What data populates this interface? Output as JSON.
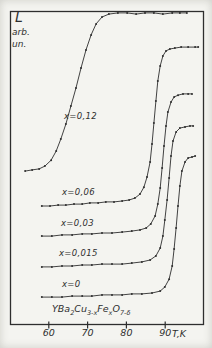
{
  "figure": {
    "kind": "scanned hand-drawn scientific plot",
    "ink_color": "#2e2e2e",
    "paper_color": "#f4f4f0"
  },
  "y_axis": {
    "label_main": "L",
    "label_sub1": "arb.",
    "label_sub2": "un.",
    "scale": "arbitrary units (no numeric ticks)"
  },
  "x_axis": {
    "unit_label": "T,K",
    "t_min": 50,
    "px_at_min": 10,
    "px_per_unit": 3.88,
    "ticks": [
      {
        "value": 60,
        "label": "60"
      },
      {
        "value": 70,
        "label": "70"
      },
      {
        "value": 80,
        "label": "80"
      },
      {
        "value": 90,
        "label": "90"
      }
    ]
  },
  "plot_box": {
    "x": 10,
    "y": 11,
    "w": 194,
    "h": 314
  },
  "compound": {
    "plain": "YBa2Cu3-xFexO7-δ",
    "segments": [
      {
        "t": "YBa"
      },
      {
        "t": "2",
        "sub": true
      },
      {
        "t": "Cu"
      },
      {
        "t": "3-x",
        "sub": true
      },
      {
        "t": "Fe"
      },
      {
        "t": "x",
        "sub": true
      },
      {
        "t": "O"
      },
      {
        "t": "7-δ",
        "sub": true
      }
    ]
  },
  "chart_data": {
    "type": "line",
    "title": "",
    "xlabel": "T,K",
    "ylabel": "L, arb. un.",
    "xlim": [
      50,
      100.5
    ],
    "ylim_note": "L is in arbitrary units; values below are percent of plot height as drawn (curves vertically offset in the original figure)",
    "grid": false,
    "marker": "dot markers along every curve",
    "series": [
      {
        "name": "x=0.12",
        "label": "x=0,12",
        "x_value": 0.12,
        "label_pos": [
          64,
          111
        ],
        "points": [
          [
            53.9,
            49.0
          ],
          [
            55.7,
            49.4
          ],
          [
            57.5,
            49.7
          ],
          [
            59.0,
            50.6
          ],
          [
            60.6,
            52.5
          ],
          [
            61.9,
            55.4
          ],
          [
            63.1,
            59.2
          ],
          [
            64.4,
            64.0
          ],
          [
            65.7,
            69.7
          ],
          [
            67.0,
            75.5
          ],
          [
            68.3,
            81.8
          ],
          [
            69.6,
            87.6
          ],
          [
            70.9,
            92.4
          ],
          [
            72.2,
            95.9
          ],
          [
            73.7,
            98.1
          ],
          [
            75.5,
            99.0
          ],
          [
            77.8,
            99.4
          ],
          [
            80.2,
            99.4
          ],
          [
            82.5,
            99.0
          ],
          [
            84.8,
            99.4
          ],
          [
            87.1,
            99.4
          ],
          [
            89.4,
            99.0
          ],
          [
            91.8,
            99.4
          ],
          [
            93.8,
            99.4
          ],
          [
            95.6,
            99.4
          ]
        ]
      },
      {
        "name": "x=0.06",
        "label": "x=0,06",
        "x_value": 0.06,
        "label_pos": [
          62,
          187
        ],
        "points": [
          [
            58.2,
            37.9
          ],
          [
            60.3,
            37.9
          ],
          [
            62.4,
            38.2
          ],
          [
            64.4,
            38.2
          ],
          [
            66.5,
            38.5
          ],
          [
            68.6,
            38.5
          ],
          [
            70.6,
            38.9
          ],
          [
            72.7,
            38.9
          ],
          [
            74.7,
            39.2
          ],
          [
            76.8,
            39.2
          ],
          [
            78.9,
            39.5
          ],
          [
            80.7,
            39.8
          ],
          [
            82.2,
            40.4
          ],
          [
            83.5,
            41.7
          ],
          [
            84.5,
            43.9
          ],
          [
            85.3,
            47.1
          ],
          [
            86.1,
            51.9
          ],
          [
            86.6,
            57.6
          ],
          [
            87.1,
            64.3
          ],
          [
            87.6,
            71.3
          ],
          [
            88.1,
            77.7
          ],
          [
            88.7,
            82.5
          ],
          [
            89.4,
            85.7
          ],
          [
            90.2,
            87.3
          ],
          [
            91.2,
            87.9
          ],
          [
            92.5,
            88.2
          ],
          [
            94.1,
            88.5
          ],
          [
            95.9,
            88.5
          ],
          [
            97.7,
            88.5
          ],
          [
            98.5,
            88.5
          ]
        ]
      },
      {
        "name": "x=0.03",
        "label": "x=0,03",
        "x_value": 0.03,
        "label_pos": [
          61,
          218
        ],
        "points": [
          [
            58.2,
            28.3
          ],
          [
            60.8,
            28.3
          ],
          [
            63.4,
            28.7
          ],
          [
            66.0,
            28.7
          ],
          [
            68.6,
            29.0
          ],
          [
            71.1,
            29.0
          ],
          [
            73.7,
            29.3
          ],
          [
            76.3,
            29.3
          ],
          [
            78.9,
            29.6
          ],
          [
            81.4,
            29.9
          ],
          [
            83.5,
            30.3
          ],
          [
            85.1,
            30.9
          ],
          [
            86.3,
            32.2
          ],
          [
            87.4,
            34.7
          ],
          [
            88.1,
            38.5
          ],
          [
            88.7,
            43.6
          ],
          [
            89.2,
            50.0
          ],
          [
            89.7,
            57.0
          ],
          [
            90.2,
            63.4
          ],
          [
            90.7,
            67.8
          ],
          [
            91.5,
            71.0
          ],
          [
            92.3,
            72.6
          ],
          [
            93.3,
            73.2
          ],
          [
            94.6,
            73.6
          ],
          [
            95.9,
            73.6
          ],
          [
            96.9,
            73.6
          ]
        ]
      },
      {
        "name": "x=0.015",
        "label": "x=0,015",
        "x_value": 0.015,
        "label_pos": [
          59,
          248
        ],
        "points": [
          [
            58.2,
            18.5
          ],
          [
            60.8,
            18.5
          ],
          [
            63.4,
            18.8
          ],
          [
            66.0,
            18.8
          ],
          [
            68.6,
            19.1
          ],
          [
            71.1,
            19.1
          ],
          [
            73.7,
            19.4
          ],
          [
            76.3,
            19.4
          ],
          [
            78.9,
            19.4
          ],
          [
            81.4,
            19.7
          ],
          [
            84.0,
            20.1
          ],
          [
            86.1,
            20.7
          ],
          [
            87.6,
            22.0
          ],
          [
            88.7,
            24.5
          ],
          [
            89.4,
            28.3
          ],
          [
            89.9,
            33.4
          ],
          [
            90.5,
            39.8
          ],
          [
            91.0,
            46.8
          ],
          [
            91.5,
            53.8
          ],
          [
            92.0,
            58.6
          ],
          [
            92.8,
            61.5
          ],
          [
            93.8,
            62.7
          ],
          [
            95.1,
            63.1
          ],
          [
            96.4,
            63.4
          ],
          [
            97.2,
            63.4
          ]
        ]
      },
      {
        "name": "x=0",
        "label": "x=0",
        "x_value": 0,
        "label_pos": [
          62,
          279
        ],
        "points": [
          [
            58.2,
            8.9
          ],
          [
            60.8,
            8.9
          ],
          [
            63.4,
            8.9
          ],
          [
            66.0,
            9.2
          ],
          [
            68.6,
            9.2
          ],
          [
            71.1,
            9.2
          ],
          [
            73.7,
            9.6
          ],
          [
            76.3,
            9.6
          ],
          [
            78.9,
            9.6
          ],
          [
            81.4,
            9.9
          ],
          [
            84.0,
            9.9
          ],
          [
            86.6,
            10.2
          ],
          [
            88.7,
            10.8
          ],
          [
            89.9,
            12.1
          ],
          [
            91.0,
            14.6
          ],
          [
            91.8,
            18.8
          ],
          [
            92.3,
            24.2
          ],
          [
            92.8,
            30.9
          ],
          [
            93.3,
            37.9
          ],
          [
            93.8,
            44.3
          ],
          [
            94.3,
            49.0
          ],
          [
            95.1,
            51.9
          ],
          [
            95.9,
            53.2
          ],
          [
            96.9,
            53.5
          ],
          [
            97.7,
            53.8
          ]
        ]
      }
    ]
  }
}
